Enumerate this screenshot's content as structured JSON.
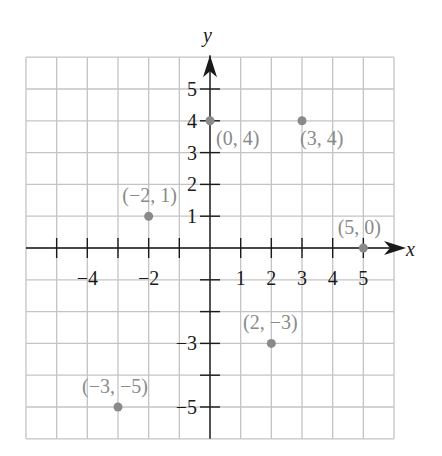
{
  "chart_data": {
    "type": "scatter",
    "title": "",
    "xlabel": "x",
    "ylabel": "y",
    "xlim": [
      -6,
      6
    ],
    "ylim": [
      -6,
      6
    ],
    "grid": true,
    "x_tick_labels": [
      {
        "value": -4,
        "label": "−4"
      },
      {
        "value": -2,
        "label": "−2"
      },
      {
        "value": 1,
        "label": "1"
      },
      {
        "value": 2,
        "label": "2"
      },
      {
        "value": 3,
        "label": "3"
      },
      {
        "value": 4,
        "label": "4"
      },
      {
        "value": 5,
        "label": "5"
      }
    ],
    "y_tick_labels": [
      {
        "value": 5,
        "label": "5"
      },
      {
        "value": 4,
        "label": "4"
      },
      {
        "value": 3,
        "label": "3"
      },
      {
        "value": 2,
        "label": "2"
      },
      {
        "value": 1,
        "label": "1"
      },
      {
        "value": -3,
        "label": "−3"
      },
      {
        "value": -5,
        "label": "−5"
      }
    ],
    "points": [
      {
        "x": 0,
        "y": 4,
        "label": "(0, 4)"
      },
      {
        "x": 3,
        "y": 4,
        "label": "(3, 4)"
      },
      {
        "x": -2,
        "y": 1,
        "label": "(−2, 1)"
      },
      {
        "x": 5,
        "y": 0,
        "label": "(5, 0)"
      },
      {
        "x": 2,
        "y": -3,
        "label": "(2, −3)"
      },
      {
        "x": -3,
        "y": -5,
        "label": "(−3, −5)"
      }
    ]
  },
  "colors": {
    "grid": "#c4c4c4",
    "axis": "#1a1a1a",
    "point": "#8a8a8a",
    "point_label": "#8a8a8a",
    "tick_label": "#1a1a1a"
  }
}
